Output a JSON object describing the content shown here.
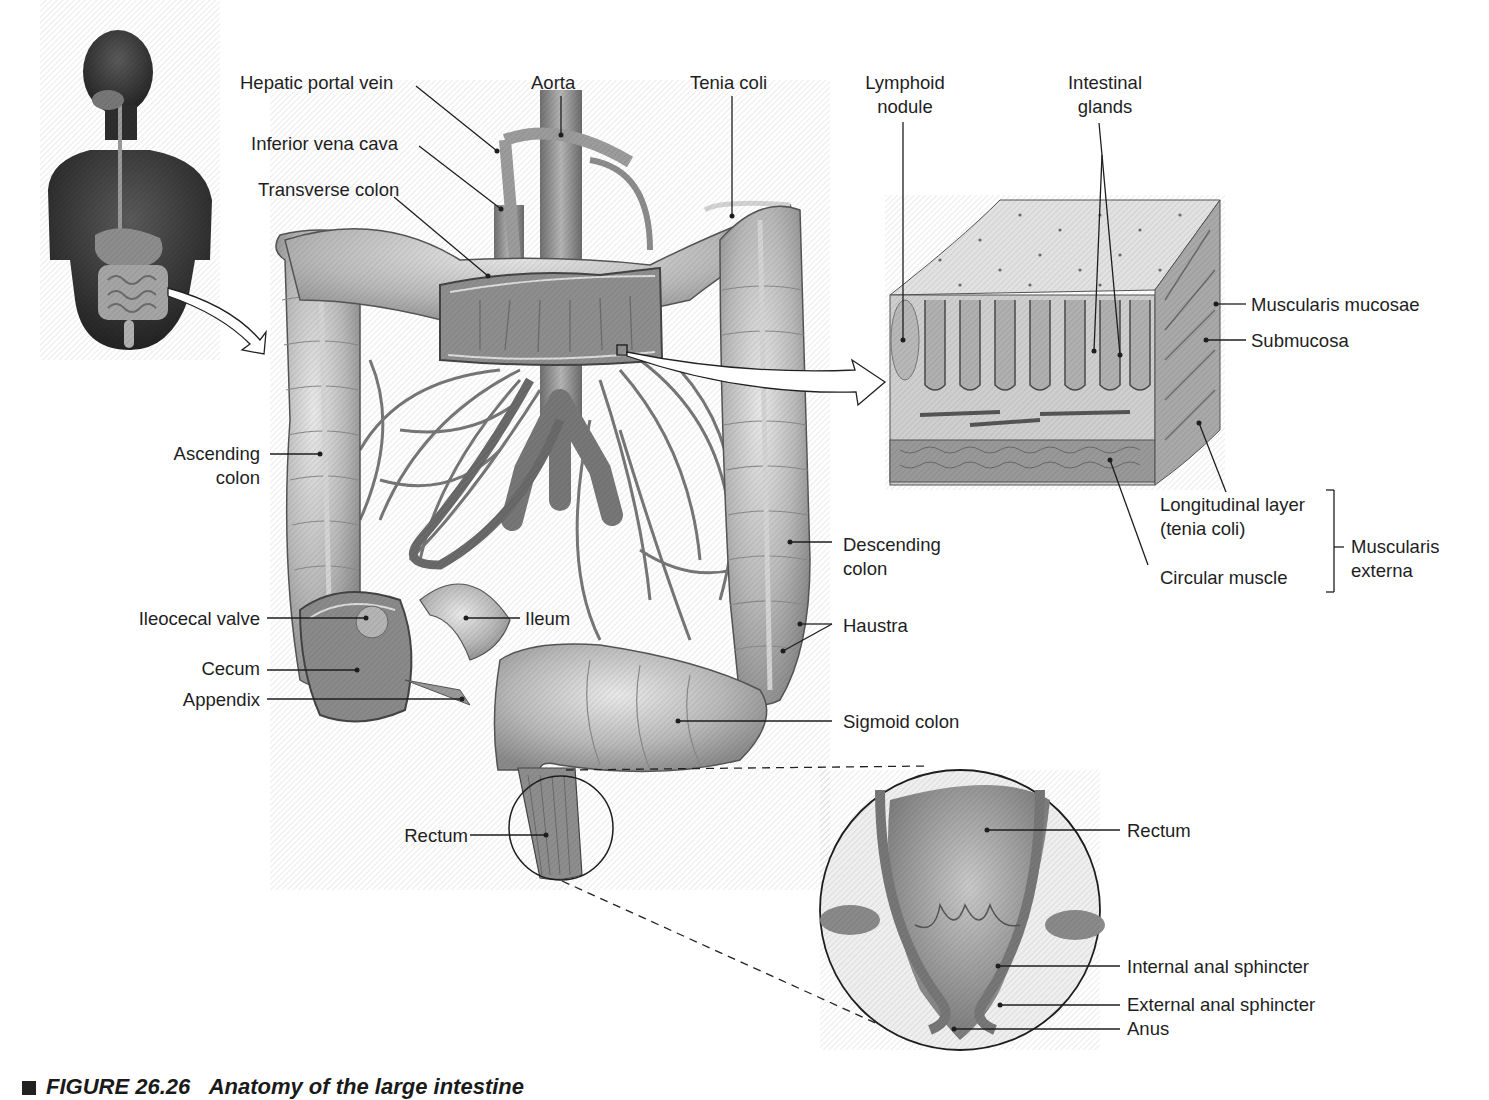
{
  "figure": {
    "caption_number": "FIGURE 26.26",
    "caption_title": "Anatomy of the large intestine",
    "background": "#ffffff",
    "line_color": "#1e1e1e"
  },
  "panels": {
    "orientation_figure": {
      "name": "Human torso with digestive tract (orientation)"
    },
    "main_view": {
      "name": "Large intestine with vasculature"
    },
    "wall_section": {
      "name": "Colon wall tissue block"
    },
    "anal_canal_inset": {
      "name": "Rectum and anal canal magnified"
    }
  },
  "labels": {
    "hepatic_portal_vein": "Hepatic portal vein",
    "aorta": "Aorta",
    "tenia_coli": "Tenia coli",
    "inferior_vena_cava": "Inferior vena cava",
    "transverse_colon": "Transverse colon",
    "lymphoid_nodule_l1": "Lymphoid",
    "lymphoid_nodule_l2": "nodule",
    "intestinal_glands_l1": "Intestinal",
    "intestinal_glands_l2": "glands",
    "muscularis_mucosae": "Muscularis mucosae",
    "submucosa": "Submucosa",
    "longitudinal_layer_l1": "Longitudinal layer",
    "longitudinal_layer_l2": "(tenia coli)",
    "circular_muscle": "Circular muscle",
    "muscularis_externa_l1": "Muscularis",
    "muscularis_externa_l2": "externa",
    "ascending_colon_l1": "Ascending",
    "ascending_colon_l2": "colon",
    "descending_colon_l1": "Descending",
    "descending_colon_l2": "colon",
    "haustra": "Haustra",
    "ileocecal_valve": "Ileocecal valve",
    "ileum": "Ileum",
    "cecum": "Cecum",
    "appendix": "Appendix",
    "sigmoid_colon": "Sigmoid colon",
    "rectum_main": "Rectum",
    "rectum_inset": "Rectum",
    "internal_anal_sphincter": "Internal anal sphincter",
    "external_anal_sphincter": "External anal sphincter",
    "anus": "Anus"
  }
}
